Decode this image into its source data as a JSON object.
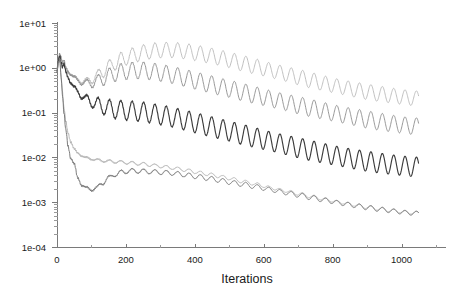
{
  "chart_data": {
    "type": "line",
    "title": "",
    "subtitle": "",
    "xlabel": "Iterations",
    "ylabel": "",
    "xscale": "linear",
    "yscale": "log",
    "xlim": [
      0,
      1100
    ],
    "ylim": [
      0.0001,
      10
    ],
    "grid": false,
    "legend": "none",
    "background": "#ffffff",
    "x_ticks": [
      {
        "value": 0,
        "label": "0"
      },
      {
        "value": 200,
        "label": "200"
      },
      {
        "value": 400,
        "label": "400"
      },
      {
        "value": 600,
        "label": "600"
      },
      {
        "value": 800,
        "label": "800"
      },
      {
        "value": 1000,
        "label": "1000"
      }
    ],
    "y_ticks": [
      {
        "value": 10,
        "label": "1e+01"
      },
      {
        "value": 1,
        "label": "1e+00"
      },
      {
        "value": 0.1,
        "label": "1e-01"
      },
      {
        "value": 0.01,
        "label": "1e-02"
      },
      {
        "value": 0.001,
        "label": "1e-03"
      },
      {
        "value": 0.0001,
        "label": "1e-04"
      }
    ],
    "annotations": [],
    "series": [
      {
        "name": "curve-1",
        "color": "#b9b9b9",
        "width": 0.9,
        "oscillation_amplitude_log": 0.17,
        "oscillation_period": 33,
        "x": [
          0,
          4,
          8,
          12,
          16,
          20,
          26,
          32,
          40,
          50,
          60,
          72,
          85,
          100,
          115,
          130,
          150,
          170,
          190,
          210,
          230,
          250,
          270,
          290,
          310,
          330,
          350,
          380,
          410,
          440,
          470,
          500,
          540,
          580,
          620,
          660,
          700,
          740,
          780,
          820,
          860,
          900,
          940,
          980,
          1020,
          1050
        ],
        "y": [
          0.95,
          1.45,
          1.95,
          1.75,
          1.35,
          1.15,
          0.95,
          0.8,
          0.72,
          0.62,
          0.55,
          0.5,
          0.5,
          0.55,
          0.65,
          0.8,
          1.05,
          1.3,
          1.55,
          1.8,
          2.0,
          2.2,
          2.35,
          2.45,
          2.5,
          2.5,
          2.45,
          2.3,
          2.1,
          1.9,
          1.7,
          1.5,
          1.25,
          1.05,
          0.88,
          0.74,
          0.62,
          0.52,
          0.44,
          0.38,
          0.33,
          0.29,
          0.26,
          0.235,
          0.215,
          0.205
        ]
      },
      {
        "name": "curve-2",
        "color": "#8c8c8c",
        "width": 0.9,
        "oscillation_amplitude_log": 0.19,
        "oscillation_period": 33,
        "x": [
          0,
          4,
          8,
          12,
          16,
          20,
          26,
          32,
          40,
          50,
          60,
          72,
          85,
          100,
          115,
          130,
          150,
          170,
          190,
          210,
          230,
          250,
          270,
          290,
          310,
          330,
          350,
          380,
          410,
          440,
          470,
          500,
          540,
          580,
          620,
          660,
          700,
          740,
          780,
          820,
          860,
          900,
          940,
          980,
          1020,
          1050
        ],
        "y": [
          0.9,
          1.6,
          2.1,
          1.6,
          1.25,
          1.45,
          1.0,
          0.85,
          0.72,
          0.6,
          0.52,
          0.47,
          0.45,
          0.46,
          0.5,
          0.56,
          0.66,
          0.75,
          0.82,
          0.86,
          0.88,
          0.87,
          0.84,
          0.8,
          0.75,
          0.7,
          0.65,
          0.57,
          0.5,
          0.44,
          0.385,
          0.34,
          0.285,
          0.24,
          0.203,
          0.172,
          0.146,
          0.125,
          0.107,
          0.092,
          0.08,
          0.07,
          0.062,
          0.056,
          0.051,
          0.049
        ]
      },
      {
        "name": "curve-3",
        "color": "#3c3c3c",
        "width": 1.15,
        "oscillation_amplitude_log": 0.22,
        "oscillation_period": 33,
        "x": [
          0,
          4,
          8,
          12,
          16,
          20,
          26,
          32,
          40,
          50,
          60,
          72,
          85,
          100,
          115,
          130,
          150,
          170,
          190,
          210,
          230,
          250,
          270,
          290,
          310,
          330,
          350,
          380,
          410,
          440,
          470,
          500,
          540,
          580,
          620,
          660,
          700,
          740,
          780,
          820,
          860,
          900,
          940,
          980,
          1020,
          1050
        ],
        "y": [
          0.85,
          1.5,
          1.9,
          1.3,
          1.0,
          1.2,
          0.8,
          0.62,
          0.47,
          0.36,
          0.29,
          0.235,
          0.2,
          0.175,
          0.155,
          0.14,
          0.125,
          0.118,
          0.113,
          0.11,
          0.107,
          0.103,
          0.098,
          0.092,
          0.086,
          0.08,
          0.074,
          0.065,
          0.057,
          0.05,
          0.044,
          0.0385,
          0.0322,
          0.027,
          0.0228,
          0.0193,
          0.0164,
          0.014,
          0.0121,
          0.0105,
          0.0092,
          0.0082,
          0.0074,
          0.0068,
          0.0063,
          0.0061
        ]
      },
      {
        "name": "curve-4",
        "color": "#b0b0b0",
        "width": 0.9,
        "oscillation_amplitude_log": 0.035,
        "oscillation_period": 33,
        "x": [
          0,
          4,
          8,
          12,
          16,
          20,
          26,
          32,
          40,
          50,
          60,
          72,
          85,
          100,
          115,
          130,
          150,
          170,
          190,
          210,
          230,
          250,
          270,
          290,
          310,
          330,
          350,
          380,
          410,
          440,
          470,
          500,
          540,
          580,
          620,
          660,
          700,
          740,
          780,
          820,
          860,
          900,
          940,
          980,
          1020,
          1050
        ],
        "y": [
          0.8,
          1.3,
          1.5,
          0.65,
          0.28,
          0.13,
          0.062,
          0.035,
          0.022,
          0.0155,
          0.0125,
          0.0108,
          0.0098,
          0.0092,
          0.0088,
          0.0085,
          0.0082,
          0.008,
          0.0078,
          0.0076,
          0.0073,
          0.0071,
          0.0068,
          0.0065,
          0.0062,
          0.0059,
          0.0056,
          0.0051,
          0.0046,
          0.0042,
          0.0038,
          0.0034,
          0.0029,
          0.0025,
          0.0021,
          0.0018,
          0.00155,
          0.00133,
          0.00115,
          0.001,
          0.00088,
          0.00078,
          0.0007,
          0.00064,
          0.00059,
          0.00057
        ]
      },
      {
        "name": "curve-5",
        "color": "#6e6e6e",
        "width": 0.9,
        "oscillation_amplitude_log": 0.05,
        "oscillation_period": 33,
        "x": [
          0,
          4,
          8,
          12,
          16,
          20,
          26,
          32,
          40,
          50,
          60,
          72,
          85,
          100,
          115,
          130,
          150,
          170,
          190,
          210,
          230,
          250,
          270,
          290,
          310,
          330,
          350,
          380,
          410,
          440,
          470,
          500,
          540,
          580,
          620,
          660,
          700,
          740,
          780,
          820,
          860,
          900,
          940,
          980,
          1020,
          1050
        ],
        "y": [
          0.82,
          1.35,
          1.55,
          0.6,
          0.24,
          0.1,
          0.04,
          0.018,
          0.0095,
          0.0072,
          0.0035,
          0.0024,
          0.0021,
          0.0019,
          0.0021,
          0.0026,
          0.0035,
          0.0042,
          0.0047,
          0.005,
          0.005,
          0.0049,
          0.0048,
          0.0047,
          0.0046,
          0.0045,
          0.0043,
          0.004,
          0.0037,
          0.0034,
          0.0031,
          0.0028,
          0.0025,
          0.0022,
          0.0019,
          0.00165,
          0.00145,
          0.00126,
          0.0011,
          0.00096,
          0.00085,
          0.00076,
          0.00069,
          0.00063,
          0.00058,
          0.00056
        ]
      }
    ]
  },
  "geometry": {
    "plot_left": 57,
    "plot_right": 436,
    "plot_top": 23,
    "plot_bottom": 247,
    "x_axis_title_x": 247,
    "x_axis_title_y": 283
  }
}
